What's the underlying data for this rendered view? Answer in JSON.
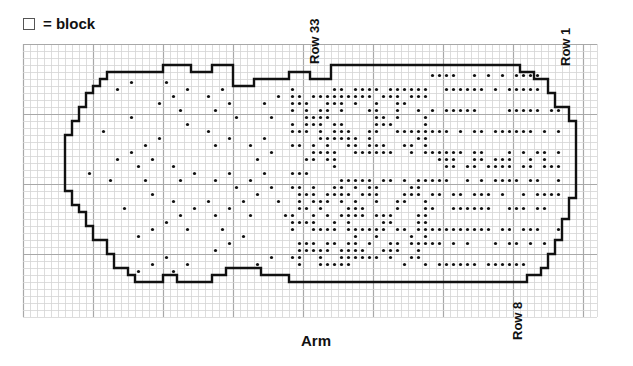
{
  "legend": {
    "symbol": "block-square",
    "text": "= block"
  },
  "labels": {
    "row_33": "Row 33",
    "row_1": "Row 1",
    "row_8": "Row 8",
    "arm": "Arm"
  },
  "chart": {
    "type": "needlepoint-grid-chart",
    "grid": {
      "cell_px": 7,
      "major_every": 10,
      "cols": 82,
      "rows": 39,
      "origin": [
        23,
        44
      ]
    },
    "colors": {
      "grid_minor": "#d4d4d4",
      "grid_major": "#a8a8a8",
      "outline": "#111111",
      "dot": "#111111"
    }
  }
}
